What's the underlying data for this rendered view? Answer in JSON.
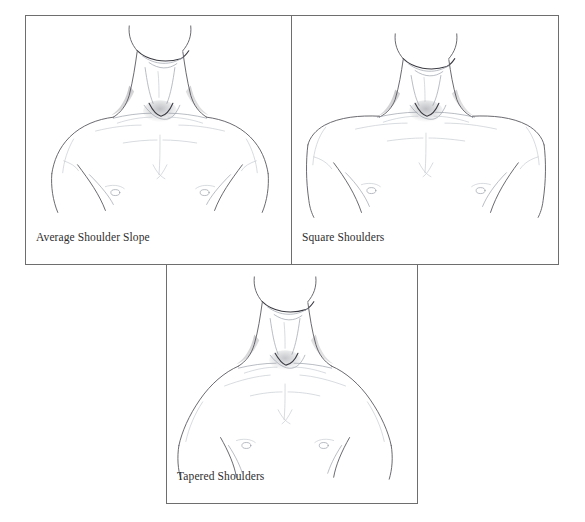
{
  "figure": {
    "background_color": "#ffffff",
    "panel_border_color": "#6e6e6e",
    "caption_color": "#2e2e2e",
    "line_color": "#58585e"
  },
  "panels": [
    {
      "id": "average",
      "caption": "Average Shoulder Slope",
      "subject": "front view of male neck, shoulders and upper chest",
      "x": 25,
      "y": 15,
      "width": 267,
      "height": 250
    },
    {
      "id": "square",
      "caption": "Square Shoulders",
      "subject": "front view of male neck, shoulders and upper chest",
      "x": 291,
      "y": 15,
      "width": 268,
      "height": 250
    },
    {
      "id": "tapered",
      "caption": "Tapered Shoulders",
      "subject": "front view of male neck, shoulders and upper chest",
      "x": 166,
      "y": 264,
      "width": 252,
      "height": 240
    }
  ]
}
